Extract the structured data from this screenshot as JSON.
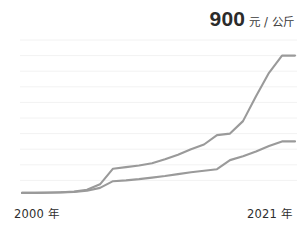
{
  "chart_data": {
    "type": "line",
    "title": "900 元 / 公斤",
    "title_value": "900",
    "title_unit": "元 / 公斤",
    "xlabel": "",
    "ylabel": "",
    "xlim": [
      2000,
      2021
    ],
    "ylim": [
      0,
      1000
    ],
    "grid": true,
    "gridlines_y": [
      100,
      200,
      300,
      400,
      500,
      600,
      700,
      800,
      900,
      1000
    ],
    "legend_position": "none",
    "axis_tick_labels": {
      "x_start": "2000 年",
      "x_end": "2021 年"
    },
    "x": [
      2000,
      2001,
      2002,
      2003,
      2004,
      2005,
      2006,
      2007,
      2008,
      2009,
      2010,
      2011,
      2012,
      2013,
      2014,
      2015,
      2016,
      2017,
      2018,
      2019,
      2020,
      2021
    ],
    "series": [
      {
        "name": "upper-line",
        "color": "#9a9a9a",
        "values": [
          20,
          20,
          22,
          24,
          28,
          40,
          75,
          175,
          185,
          195,
          210,
          235,
          265,
          300,
          330,
          390,
          400,
          480,
          640,
          790,
          900,
          900
        ]
      },
      {
        "name": "lower-line",
        "color": "#9a9a9a",
        "values": [
          20,
          20,
          21,
          23,
          26,
          34,
          52,
          95,
          100,
          108,
          118,
          128,
          140,
          152,
          162,
          172,
          230,
          255,
          285,
          320,
          350,
          350
        ]
      }
    ]
  },
  "axis": {
    "start_label": "2000 年",
    "end_label": "2021 年"
  },
  "title": {
    "value": "900",
    "unit": "元 / 公斤"
  },
  "colors": {
    "line": "#9a9a9a",
    "grid": "#f2f2f2",
    "title_text": "#2b2b2b",
    "axis_text": "#2e2e2e",
    "background": "#ffffff"
  }
}
